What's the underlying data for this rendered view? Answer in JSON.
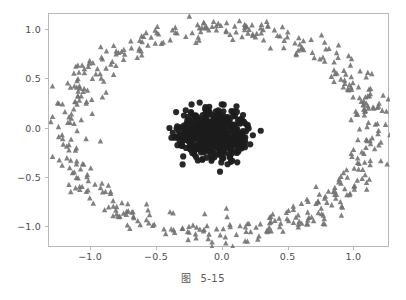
{
  "figure": {
    "caption_label": "图",
    "caption_number": "5-15",
    "background_color": "#ffffff",
    "frame_color": "#b9b9b9",
    "tick_label_color": "#4d4d4d"
  },
  "chart_data": {
    "type": "scatter",
    "title": "",
    "xlabel": "",
    "ylabel": "",
    "xlim": [
      -1.32,
      1.27
    ],
    "ylim": [
      -1.21,
      1.16
    ],
    "xticks": [
      -1.0,
      -0.5,
      0.0,
      0.5,
      1.0
    ],
    "yticks": [
      -1.0,
      -0.5,
      0.0,
      0.5,
      1.0
    ],
    "xtick_labels": [
      "−1.0",
      "−0.5",
      "0.0",
      "0.5",
      "1.0"
    ],
    "ytick_labels": [
      "−1.0",
      "−0.5",
      "0.0",
      "0.5",
      "1.0"
    ],
    "grid": false,
    "legend": null,
    "series": [
      {
        "name": "outer-ring",
        "marker": "triangle-up",
        "color": "#6f6f6f",
        "marker_size_px": 5.4,
        "n_points": 500,
        "geometry": {
          "shape": "ring",
          "center": [
            -0.035,
            -0.02
          ],
          "radius_mean": 1.0,
          "radius_jitter": 0.13,
          "x_scale": 1.16,
          "y_scale": 1.04
        }
      },
      {
        "name": "inner-blob",
        "marker": "circle",
        "color": "#1c1c1c",
        "marker_size_px": 6.2,
        "n_points": 500,
        "geometry": {
          "shape": "disk",
          "center": [
            -0.085,
            -0.055
          ],
          "radius_mean": 0.26,
          "radius_jitter": 0.14,
          "x_scale": 1.02,
          "y_scale": 0.95
        }
      }
    ]
  }
}
